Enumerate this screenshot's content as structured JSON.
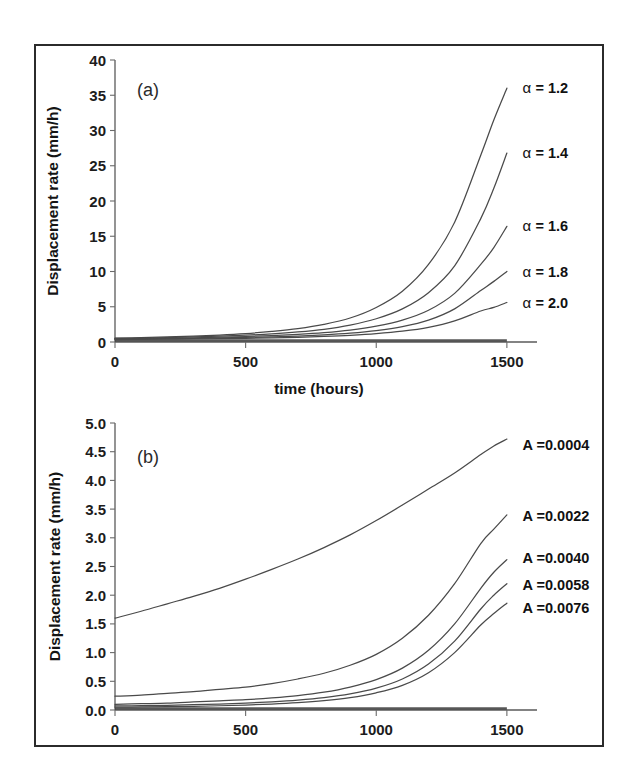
{
  "figure": {
    "panel_a_letter": "(a)",
    "panel_b_letter": "(b)"
  },
  "chart_data": [
    {
      "type": "line",
      "panel": "(a)",
      "title": "",
      "xlabel": "time (hours)",
      "ylabel": "Displacement rate (mm/h)",
      "xlim": [
        0,
        1600
      ],
      "ylim": [
        0,
        40
      ],
      "xticks": [
        0,
        500,
        1000,
        1500
      ],
      "xticklabels": [
        "0",
        "500",
        "1000",
        "1500"
      ],
      "yticks": [
        0,
        5,
        10,
        15,
        20,
        25,
        30,
        35,
        40
      ],
      "yticklabels": [
        "0",
        "5",
        "10",
        "15",
        "20",
        "25",
        "30",
        "35",
        "40"
      ],
      "grid": false,
      "legend_position": "right-inline-annotations",
      "series": [
        {
          "name": "alpha = 1.2",
          "label": "α = 1.2",
          "label_x": 1560,
          "label_y": 36.0,
          "x": [
            0,
            100,
            200,
            300,
            400,
            500,
            600,
            700,
            800,
            900,
            1000,
            1100,
            1200,
            1300,
            1400,
            1450,
            1500
          ],
          "values": [
            0.55,
            0.62,
            0.72,
            0.84,
            0.99,
            1.2,
            1.5,
            1.9,
            2.5,
            3.4,
            4.9,
            7.2,
            11.0,
            17.0,
            26.5,
            31.5,
            36.0
          ]
        },
        {
          "name": "alpha = 1.4",
          "label": "α = 1.4",
          "label_x": 1560,
          "label_y": 26.8,
          "x": [
            0,
            100,
            200,
            300,
            400,
            500,
            600,
            700,
            800,
            900,
            1000,
            1100,
            1200,
            1300,
            1400,
            1450,
            1500
          ],
          "values": [
            0.5,
            0.55,
            0.62,
            0.71,
            0.82,
            0.96,
            1.15,
            1.42,
            1.8,
            2.4,
            3.3,
            4.7,
            7.0,
            10.8,
            17.5,
            21.8,
            26.8
          ]
        },
        {
          "name": "alpha = 1.6",
          "label": "α = 1.6",
          "label_x": 1560,
          "label_y": 16.4,
          "x": [
            0,
            100,
            200,
            300,
            400,
            500,
            600,
            700,
            800,
            900,
            1000,
            1100,
            1200,
            1300,
            1400,
            1450,
            1500
          ],
          "values": [
            0.45,
            0.49,
            0.54,
            0.6,
            0.68,
            0.78,
            0.91,
            1.09,
            1.34,
            1.7,
            2.25,
            3.1,
            4.5,
            6.9,
            11.0,
            13.4,
            16.4
          ]
        },
        {
          "name": "alpha = 1.8",
          "label": "α = 1.8",
          "label_x": 1560,
          "label_y": 10.0,
          "x": [
            0,
            100,
            200,
            300,
            400,
            500,
            600,
            700,
            800,
            900,
            1000,
            1100,
            1200,
            1300,
            1400,
            1450,
            1500
          ],
          "values": [
            0.4,
            0.43,
            0.47,
            0.51,
            0.57,
            0.64,
            0.73,
            0.85,
            1.02,
            1.26,
            1.62,
            2.18,
            3.1,
            4.7,
            7.3,
            8.6,
            10.0
          ]
        },
        {
          "name": "alpha = 2.0",
          "label": "α = 2.0",
          "label_x": 1560,
          "label_y": 5.6,
          "x": [
            0,
            100,
            200,
            300,
            400,
            500,
            600,
            700,
            800,
            900,
            1000,
            1100,
            1200,
            1300,
            1400,
            1450,
            1500
          ],
          "values": [
            0.35,
            0.37,
            0.4,
            0.43,
            0.47,
            0.52,
            0.58,
            0.67,
            0.79,
            0.95,
            1.18,
            1.53,
            2.08,
            3.0,
            4.4,
            4.9,
            5.6
          ]
        }
      ]
    },
    {
      "type": "line",
      "panel": "(b)",
      "title": "",
      "xlabel": "",
      "ylabel": "Displacement rate (mm/h)",
      "xlim": [
        0,
        1600
      ],
      "ylim": [
        0.0,
        5.0
      ],
      "xticks": [
        0,
        500,
        1000,
        1500
      ],
      "xticklabels": [
        "0",
        "500",
        "1000",
        "1500"
      ],
      "yticks": [
        0.0,
        0.5,
        1.0,
        1.5,
        2.0,
        2.5,
        3.0,
        3.5,
        4.0,
        4.5,
        5.0
      ],
      "yticklabels": [
        "0.0",
        "0.5",
        "1.0",
        "1.5",
        "2.0",
        "2.5",
        "3.0",
        "3.5",
        "4.0",
        "4.5",
        "5.0"
      ],
      "grid": false,
      "legend_position": "right-inline-annotations",
      "series": [
        {
          "name": "A = 0.0004",
          "label": "A =0.0004",
          "label_x": 1560,
          "label_y": 4.62,
          "x": [
            0,
            100,
            200,
            300,
            400,
            500,
            600,
            700,
            800,
            900,
            1000,
            1100,
            1200,
            1300,
            1400,
            1450,
            1500
          ],
          "values": [
            1.6,
            1.72,
            1.85,
            1.98,
            2.12,
            2.28,
            2.45,
            2.63,
            2.83,
            3.05,
            3.3,
            3.57,
            3.85,
            4.13,
            4.45,
            4.6,
            4.72
          ]
        },
        {
          "name": "A = 0.0022",
          "label": "A =0.0022",
          "label_x": 1560,
          "label_y": 3.38,
          "x": [
            0,
            100,
            200,
            300,
            400,
            500,
            600,
            700,
            800,
            900,
            1000,
            1100,
            1200,
            1300,
            1400,
            1450,
            1500
          ],
          "values": [
            0.24,
            0.26,
            0.29,
            0.32,
            0.36,
            0.4,
            0.46,
            0.54,
            0.64,
            0.78,
            0.97,
            1.25,
            1.65,
            2.2,
            2.9,
            3.15,
            3.4
          ]
        },
        {
          "name": "A = 0.0040",
          "label": "A =0.0040",
          "label_x": 1560,
          "label_y": 2.64,
          "x": [
            0,
            100,
            200,
            300,
            400,
            500,
            600,
            700,
            800,
            900,
            1000,
            1100,
            1200,
            1300,
            1400,
            1450,
            1500
          ],
          "values": [
            0.1,
            0.11,
            0.12,
            0.14,
            0.16,
            0.18,
            0.21,
            0.25,
            0.31,
            0.4,
            0.53,
            0.73,
            1.04,
            1.5,
            2.12,
            2.4,
            2.62
          ]
        },
        {
          "name": "A = 0.0058",
          "label": "A =0.0058",
          "label_x": 1560,
          "label_y": 2.18,
          "x": [
            0,
            100,
            200,
            300,
            400,
            500,
            600,
            700,
            800,
            900,
            1000,
            1100,
            1200,
            1300,
            1400,
            1450,
            1500
          ],
          "values": [
            0.07,
            0.075,
            0.082,
            0.092,
            0.104,
            0.12,
            0.142,
            0.172,
            0.215,
            0.28,
            0.38,
            0.54,
            0.8,
            1.2,
            1.76,
            2.0,
            2.2
          ]
        },
        {
          "name": "A = 0.0076",
          "label": "A =0.0076",
          "label_x": 1560,
          "label_y": 1.78,
          "x": [
            0,
            100,
            200,
            300,
            400,
            500,
            600,
            700,
            800,
            900,
            1000,
            1100,
            1200,
            1300,
            1400,
            1450,
            1500
          ],
          "values": [
            0.05,
            0.053,
            0.058,
            0.065,
            0.074,
            0.086,
            0.103,
            0.127,
            0.162,
            0.215,
            0.3,
            0.43,
            0.65,
            1.0,
            1.48,
            1.68,
            1.86
          ]
        }
      ]
    }
  ]
}
